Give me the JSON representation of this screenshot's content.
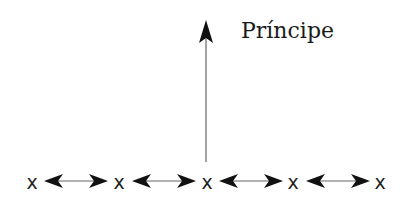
{
  "diagram": {
    "label": "Príncipe",
    "nodes": [
      {
        "id": "x1",
        "text": "x",
        "x": 32
      },
      {
        "id": "x2",
        "text": "x",
        "x": 119
      },
      {
        "id": "x3",
        "text": "x",
        "x": 207
      },
      {
        "id": "x4",
        "text": "x",
        "x": 293
      },
      {
        "id": "x5",
        "text": "x",
        "x": 380
      }
    ],
    "edges": [
      {
        "from": "x1",
        "to": "x2",
        "type": "bidirectional"
      },
      {
        "from": "x2",
        "to": "x3",
        "type": "bidirectional"
      },
      {
        "from": "x3",
        "to": "x4",
        "type": "bidirectional"
      },
      {
        "from": "x4",
        "to": "x5",
        "type": "bidirectional"
      },
      {
        "from": "x3",
        "to": "label",
        "type": "upward"
      }
    ],
    "colors": {
      "line": "#555555",
      "arrowhead": "#111111",
      "text": "#1a1a1a"
    }
  }
}
